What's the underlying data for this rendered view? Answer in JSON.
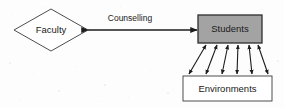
{
  "diagram": {
    "type": "flowchart",
    "background_color": "#fdfdfd",
    "nodes": [
      {
        "id": "faculty",
        "label": "Faculty",
        "shape": "diamond",
        "fill_color": "#ffffff",
        "border_color": "#3a3a3a",
        "cx": 51,
        "cy": 30,
        "rx": 37,
        "ry": 21
      },
      {
        "id": "students",
        "label": "Students",
        "shape": "rectangle",
        "fill_color": "#a3a3a3",
        "border_color": "#2e2e2e",
        "x": 198,
        "y": 15,
        "width": 64,
        "height": 28
      },
      {
        "id": "environments",
        "label": "Environments",
        "shape": "rectangle",
        "fill_color": "#ffffff",
        "border_color": "#3a3a3a",
        "x": 183,
        "y": 76,
        "width": 89,
        "height": 25
      }
    ],
    "edges": [
      {
        "id": "faculty-students",
        "label": "Counselling",
        "from": "faculty",
        "to": "students",
        "arrowheads": "both",
        "orientation": "horizontal",
        "x1": 88,
        "x2": 197,
        "y": 30,
        "stroke_width": 1.5,
        "label_x": 130,
        "label_y": 19
      },
      {
        "id": "students-environments-fan",
        "label": "",
        "from": "students",
        "to": "environments",
        "arrowheads": "both",
        "orientation": "vertical-fan",
        "count": 6,
        "stroke_width": 1.1,
        "top_y": 45,
        "bottom_y": 74,
        "top_x_positions": [
          206,
          217,
          228,
          238,
          249,
          258
        ],
        "bottom_x_positions": [
          189,
          206,
          222,
          237,
          252,
          268
        ]
      }
    ]
  }
}
